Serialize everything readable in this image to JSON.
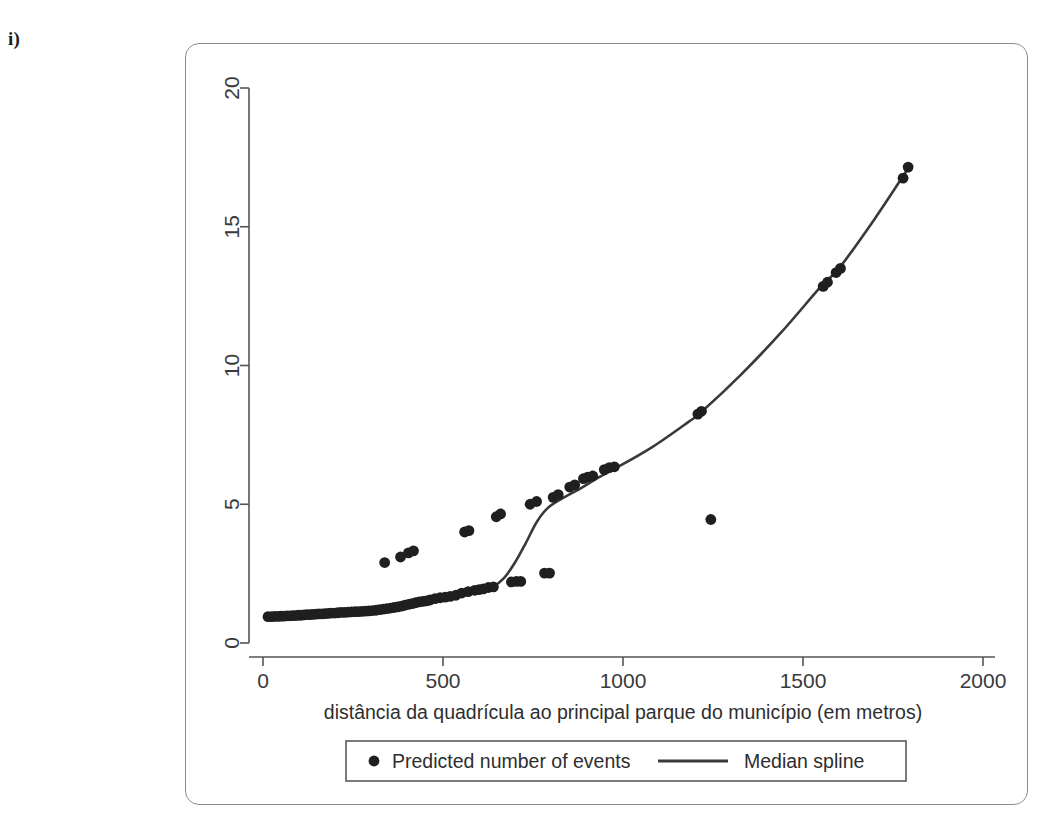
{
  "panel": {
    "label": "i)"
  },
  "chart_data": {
    "type": "scatter",
    "title": "",
    "xlabel": "distância da quadrícula ao principal parque do município (em metros)",
    "ylabel": "",
    "xlim": [
      0,
      2000
    ],
    "ylim": [
      0,
      20
    ],
    "xticks": [
      0,
      500,
      1000,
      1500,
      2000
    ],
    "yticks": [
      0,
      5,
      10,
      15,
      20
    ],
    "xtick_labels": [
      "0",
      "500",
      "1000",
      "1500",
      "2000"
    ],
    "ytick_labels": [
      "0",
      "5",
      "10",
      "15",
      "20"
    ],
    "grid": false,
    "legend_position": "below-axis",
    "marker_color": "#1f1f1f",
    "line_color": "#3a3a3a",
    "axis_color": "#555555",
    "series": [
      {
        "name": "Predicted number of events",
        "type": "scatter",
        "marker": "filled-circle",
        "points": [
          [
            14,
            0.95
          ],
          [
            24,
            0.95
          ],
          [
            33,
            0.96
          ],
          [
            42,
            0.96
          ],
          [
            50,
            0.97
          ],
          [
            58,
            0.97
          ],
          [
            66,
            0.98
          ],
          [
            74,
            0.98
          ],
          [
            82,
            0.99
          ],
          [
            90,
            0.99
          ],
          [
            98,
            1.0
          ],
          [
            106,
            1.0
          ],
          [
            114,
            1.01
          ],
          [
            122,
            1.02
          ],
          [
            130,
            1.02
          ],
          [
            138,
            1.03
          ],
          [
            147,
            1.04
          ],
          [
            155,
            1.05
          ],
          [
            164,
            1.05
          ],
          [
            172,
            1.06
          ],
          [
            181,
            1.07
          ],
          [
            190,
            1.08
          ],
          [
            199,
            1.08
          ],
          [
            208,
            1.09
          ],
          [
            217,
            1.1
          ],
          [
            226,
            1.1
          ],
          [
            236,
            1.11
          ],
          [
            245,
            1.12
          ],
          [
            255,
            1.13
          ],
          [
            264,
            1.13
          ],
          [
            274,
            1.14
          ],
          [
            284,
            1.15
          ],
          [
            294,
            1.16
          ],
          [
            304,
            1.17
          ],
          [
            314,
            1.18
          ],
          [
            324,
            1.2
          ],
          [
            334,
            1.22
          ],
          [
            344,
            1.24
          ],
          [
            354,
            1.26
          ],
          [
            364,
            1.28
          ],
          [
            374,
            1.3
          ],
          [
            384,
            1.33
          ],
          [
            394,
            1.36
          ],
          [
            404,
            1.39
          ],
          [
            414,
            1.42
          ],
          [
            424,
            1.45
          ],
          [
            434,
            1.48
          ],
          [
            444,
            1.5
          ],
          [
            454,
            1.52
          ],
          [
            464,
            1.55
          ],
          [
            478,
            1.6
          ],
          [
            492,
            1.63
          ],
          [
            506,
            1.65
          ],
          [
            520,
            1.68
          ],
          [
            536,
            1.72
          ],
          [
            552,
            1.8
          ],
          [
            570,
            1.85
          ],
          [
            588,
            1.9
          ],
          [
            600,
            1.92
          ],
          [
            612,
            1.95
          ],
          [
            626,
            2.0
          ],
          [
            640,
            2.02
          ],
          [
            338,
            2.9
          ],
          [
            382,
            3.1
          ],
          [
            404,
            3.25
          ],
          [
            418,
            3.32
          ],
          [
            560,
            4.0
          ],
          [
            572,
            4.05
          ],
          [
            648,
            4.55
          ],
          [
            660,
            4.65
          ],
          [
            690,
            2.2
          ],
          [
            704,
            2.22
          ],
          [
            716,
            2.22
          ],
          [
            782,
            2.52
          ],
          [
            796,
            2.52
          ],
          [
            742,
            5.0
          ],
          [
            760,
            5.1
          ],
          [
            806,
            5.25
          ],
          [
            820,
            5.35
          ],
          [
            852,
            5.62
          ],
          [
            866,
            5.7
          ],
          [
            890,
            5.92
          ],
          [
            902,
            5.98
          ],
          [
            916,
            6.02
          ],
          [
            948,
            6.25
          ],
          [
            962,
            6.32
          ],
          [
            976,
            6.35
          ],
          [
            1208,
            8.25
          ],
          [
            1218,
            8.35
          ],
          [
            1244,
            4.45
          ],
          [
            1556,
            12.85
          ],
          [
            1568,
            13.0
          ],
          [
            1592,
            13.35
          ],
          [
            1604,
            13.5
          ],
          [
            1778,
            16.75
          ],
          [
            1792,
            17.15
          ]
        ]
      },
      {
        "name": "Median spline",
        "type": "line",
        "points": [
          [
            16,
            0.95
          ],
          [
            120,
            1.03
          ],
          [
            240,
            1.12
          ],
          [
            360,
            1.28
          ],
          [
            470,
            1.55
          ],
          [
            540,
            1.72
          ],
          [
            600,
            1.9
          ],
          [
            640,
            2.05
          ],
          [
            670,
            2.35
          ],
          [
            700,
            2.9
          ],
          [
            730,
            3.6
          ],
          [
            760,
            4.35
          ],
          [
            790,
            4.85
          ],
          [
            830,
            5.2
          ],
          [
            880,
            5.55
          ],
          [
            930,
            5.95
          ],
          [
            980,
            6.3
          ],
          [
            1080,
            7.05
          ],
          [
            1180,
            7.95
          ],
          [
            1220,
            8.35
          ],
          [
            1330,
            9.7
          ],
          [
            1440,
            11.2
          ],
          [
            1550,
            12.85
          ],
          [
            1600,
            13.5
          ],
          [
            1700,
            15.3
          ],
          [
            1792,
            17.1
          ]
        ]
      }
    ]
  },
  "legend": {
    "items": [
      {
        "label": "Predicted number of events",
        "marker": "dot"
      },
      {
        "label": "Median spline",
        "marker": "line"
      }
    ]
  }
}
